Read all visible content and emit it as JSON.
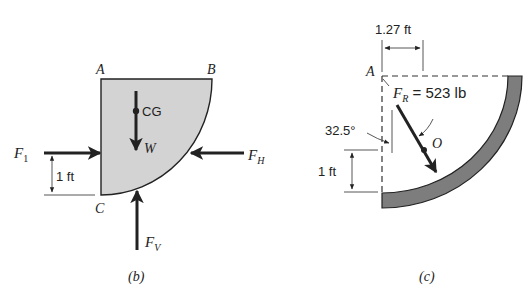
{
  "figure_b": {
    "caption": "(b)",
    "points": {
      "A": "A",
      "B": "B",
      "C": "C"
    },
    "cg_label": "CG",
    "weight_label": "W",
    "forces": {
      "F1": {
        "main": "F",
        "sub": "1"
      },
      "FH": {
        "main": "F",
        "sub": "H"
      },
      "FV": {
        "main": "F",
        "sub": "V"
      }
    },
    "dimension_label": "1 ft",
    "colors": {
      "fill": "#d2d2d2",
      "stroke": "#222222"
    }
  },
  "figure_c": {
    "caption": "(c)",
    "point_A": "A",
    "point_O": "O",
    "horizontal_dimension": "1.27 ft",
    "vertical_dimension": "1 ft",
    "angle_label": "32.5°",
    "resultant": {
      "main": "F",
      "sub": "R",
      "value": " = 523 lb"
    },
    "colors": {
      "band": "#7a7a7a",
      "stroke": "#222222"
    }
  }
}
